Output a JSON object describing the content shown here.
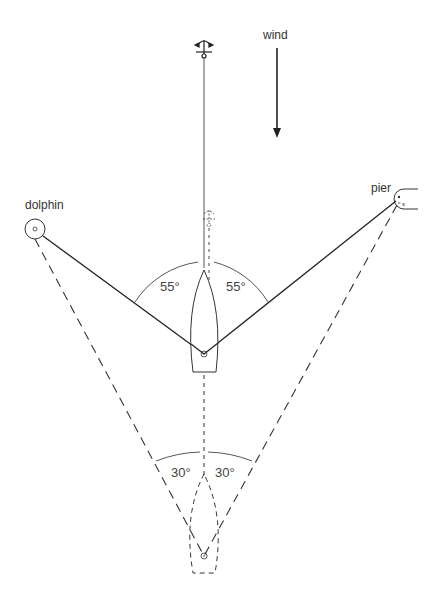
{
  "labels": {
    "wind": "wind",
    "dolphin": "dolphin",
    "pier": "pier",
    "angle_upper_left": "55°",
    "angle_upper_right": "55°",
    "angle_lower_left": "30°",
    "angle_lower_right": "30°"
  },
  "colors": {
    "line": "#222222",
    "arc": "#555555",
    "text": "#333333",
    "background": "#ffffff"
  },
  "icons": {
    "anchor": "anchor-icon",
    "wind_arrow": "arrow-down-icon",
    "dolphin": "mooring-post-icon",
    "pier_bollard": "bollard-icon"
  }
}
